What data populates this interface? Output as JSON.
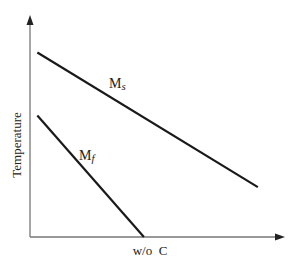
{
  "chart_data": {
    "type": "line",
    "title": "",
    "xlabel": "w/o  C",
    "ylabel": "Temperature",
    "xlim": [
      0,
      1
    ],
    "ylim": [
      0,
      1
    ],
    "grid": false,
    "legend": "none (inline labels)",
    "axis_color": "#777777",
    "line_color": "#1a1a1a",
    "series": [
      {
        "name": "Ms",
        "label_main": "M",
        "label_sub": "s",
        "x": [
          0.03,
          0.93
        ],
        "y": [
          0.85,
          0.23
        ]
      },
      {
        "name": "Mf",
        "label_main": "M",
        "label_sub": "f",
        "x": [
          0.03,
          0.465
        ],
        "y": [
          0.56,
          0.0
        ]
      }
    ]
  }
}
